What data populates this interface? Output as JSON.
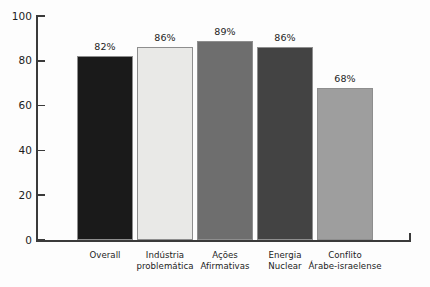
{
  "chart_data": {
    "type": "bar",
    "title": "",
    "subtitle": "",
    "xlabel": "",
    "ylabel": "",
    "categories": [
      "Overall",
      "Indústria problemática",
      "Ações Afirmativas",
      "Energia Nuclear",
      "Conflito Árabe-israelense"
    ],
    "category_lines": [
      [
        "Overall"
      ],
      [
        "Indústria",
        "problemática"
      ],
      [
        "Ações",
        "Afirmativas"
      ],
      [
        "Energia",
        "Nuclear"
      ],
      [
        "Conflito",
        "Árabe-israelense"
      ]
    ],
    "values": [
      82,
      86,
      89,
      86,
      68
    ],
    "value_labels": [
      "82%",
      "86%",
      "89%",
      "86%",
      "68%"
    ],
    "bar_colors": [
      "#1a1a1a",
      "#e9e9e7",
      "#6e6e6e",
      "#434343",
      "#9e9e9e"
    ],
    "ylim": [
      0,
      100
    ],
    "yticks": [
      0,
      20,
      40,
      60,
      80,
      100
    ],
    "ytick_labels": [
      "0",
      "20",
      "40",
      "60",
      "80",
      "100"
    ],
    "grid": false,
    "legend": "none",
    "axis_color": "#3a3a3a",
    "background_color": "#fdfdfd"
  }
}
